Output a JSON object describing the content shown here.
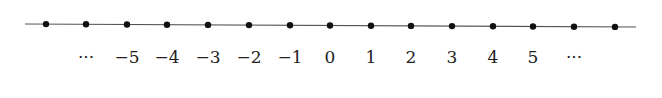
{
  "diagram": {
    "type": "number-line",
    "line": {
      "x1": 25,
      "y1": 24,
      "x2": 636,
      "y2": 27,
      "color": "#555555"
    },
    "dot_color": "#111111",
    "points": [
      {
        "x": 46,
        "label": ""
      },
      {
        "x": 86,
        "label": "···"
      },
      {
        "x": 127,
        "label": "−5"
      },
      {
        "x": 167,
        "label": "−4"
      },
      {
        "x": 208,
        "label": "−3"
      },
      {
        "x": 249,
        "label": "−2"
      },
      {
        "x": 290,
        "label": "−1"
      },
      {
        "x": 330,
        "label": "0"
      },
      {
        "x": 371,
        "label": "1"
      },
      {
        "x": 411,
        "label": "2"
      },
      {
        "x": 452,
        "label": "3"
      },
      {
        "x": 493,
        "label": "4"
      },
      {
        "x": 533,
        "label": "5"
      },
      {
        "x": 574,
        "label": "···"
      },
      {
        "x": 615,
        "label": ""
      }
    ]
  }
}
